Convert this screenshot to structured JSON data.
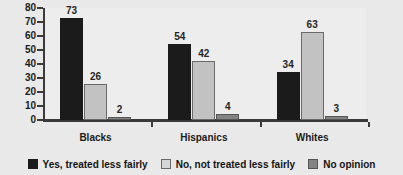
{
  "chart_data": {
    "type": "bar",
    "title": "",
    "subtitle": "",
    "xlabel": "",
    "ylabel": "",
    "categories": [
      "Blacks",
      "Hispanics",
      "Whites"
    ],
    "series": [
      {
        "name": "Yes, treated less fairly",
        "color": "#1b1b1b",
        "values": [
          73,
          54,
          34
        ]
      },
      {
        "name": "No, not treated less fairly",
        "color": "#c2c2c2",
        "values": [
          26,
          42,
          63
        ]
      },
      {
        "name": "No opinion",
        "color": "#848484",
        "values": [
          2,
          4,
          3
        ]
      }
    ],
    "ylim": [
      0,
      80
    ],
    "ytick_labels": [
      "80",
      "70",
      "60",
      "50",
      "40",
      "30",
      "20",
      "10",
      "0"
    ],
    "ytick_values": [
      80,
      70,
      60,
      50,
      40,
      30,
      20,
      10,
      0
    ],
    "grid": false,
    "legend_position": "bottom",
    "data_labels": true,
    "annotations": []
  },
  "axis": {
    "y_ticks": [
      {
        "label": "80",
        "value": 80
      },
      {
        "label": "70",
        "value": 70
      },
      {
        "label": "60",
        "value": 60
      },
      {
        "label": "50",
        "value": 50
      },
      {
        "label": "40",
        "value": 40
      },
      {
        "label": "30",
        "value": 30
      },
      {
        "label": "20",
        "value": 20
      },
      {
        "label": "10",
        "value": 10
      },
      {
        "label": "0",
        "value": 0
      }
    ]
  },
  "groups": [
    {
      "label": "Blacks",
      "bars": [
        {
          "series": "Yes, treated less fairly",
          "value": 73,
          "value_label": "73"
        },
        {
          "series": "No, not treated less fairly",
          "value": 26,
          "value_label": "26"
        },
        {
          "series": "No opinion",
          "value": 2,
          "value_label": "2"
        }
      ]
    },
    {
      "label": "Hispanics",
      "bars": [
        {
          "series": "Yes, treated less fairly",
          "value": 54,
          "value_label": "54"
        },
        {
          "series": "No, not treated less fairly",
          "value": 42,
          "value_label": "42"
        },
        {
          "series": "No opinion",
          "value": 4,
          "value_label": "4"
        }
      ]
    },
    {
      "label": "Whites",
      "bars": [
        {
          "series": "Yes, treated less fairly",
          "value": 34,
          "value_label": "34"
        },
        {
          "series": "No, not treated less fairly",
          "value": 63,
          "value_label": "63"
        },
        {
          "series": "No opinion",
          "value": 3,
          "value_label": "3"
        }
      ]
    }
  ],
  "legend": {
    "items": [
      {
        "label": "Yes, treated less fairly",
        "color": "#1b1b1b",
        "swatch": "black-square-icon"
      },
      {
        "label": "No, not treated less fairly",
        "color": "#d6d6d6",
        "swatch": "light-gray-square-icon"
      },
      {
        "label": "No opinion",
        "color": "#848484",
        "swatch": "gray-square-icon"
      }
    ]
  },
  "colors": {
    "background": "#e9e9e9",
    "plot_background": "#ededed",
    "axis": "#3a3a3a",
    "text": "#1b1b1b",
    "series_1": "#1b1b1b",
    "series_2": "#c2c2c2",
    "series_3": "#848484"
  }
}
